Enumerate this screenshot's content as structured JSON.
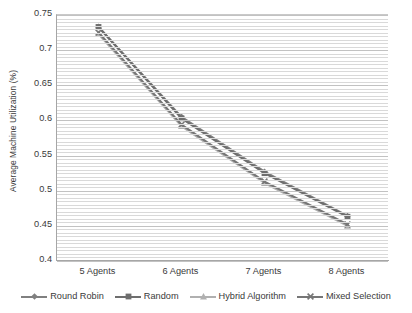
{
  "chart_data": {
    "type": "line",
    "title": "",
    "xlabel": "",
    "ylabel": "Average Machine Utilization (%)",
    "categories": [
      "5 Agents",
      "6 Agents",
      "7 Agents",
      "8 Agents"
    ],
    "ylim": [
      0.4,
      0.75
    ],
    "y_ticks": [
      0.4,
      0.45,
      0.5,
      0.55,
      0.6,
      0.65,
      0.7,
      0.75
    ],
    "y_tick_labels": [
      "0.4",
      "0.45",
      "0.5",
      "0.55",
      "0.6",
      "0.65",
      "0.7",
      "0.75"
    ],
    "y_minor_step": 0.005,
    "grid": "horizontal",
    "legend_position": "bottom",
    "series": [
      {
        "name": "Round Robin",
        "color": "#808080",
        "marker": "diamond",
        "values": [
          0.733,
          0.605,
          0.527,
          0.464
        ]
      },
      {
        "name": "Random",
        "color": "#6e6e6e",
        "marker": "square",
        "values": [
          0.733,
          0.603,
          0.525,
          0.463
        ]
      },
      {
        "name": "Hybrid Algorithm",
        "color": "#b0b0b0",
        "marker": "triangle",
        "values": [
          0.723,
          0.592,
          0.511,
          0.45
        ]
      },
      {
        "name": "Mixed Selection",
        "color": "#767676",
        "marker": "cross",
        "values": [
          0.725,
          0.594,
          0.513,
          0.452
        ]
      }
    ]
  },
  "axis": {
    "y_title": "Average Machine Utilization (%)"
  },
  "legend": {
    "items": [
      {
        "label": "Round Robin"
      },
      {
        "label": "Random"
      },
      {
        "label": "Hybrid Algorithm"
      },
      {
        "label": "Mixed Selection"
      }
    ]
  }
}
